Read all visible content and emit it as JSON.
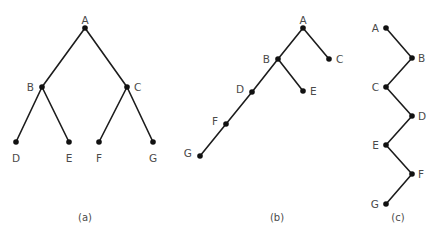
{
  "diagram": {
    "type": "binary-trees",
    "node_color": "#111111",
    "edge_color": "#1c1c1c",
    "label_color": "#4a4a4a",
    "trees": [
      {
        "id": "a",
        "caption": "(a)",
        "caption_pos": [
          85,
          217
        ],
        "description": "Complete (balanced) binary tree",
        "nodes": [
          {
            "id": "A",
            "label": "A",
            "x": 85,
            "y": 28,
            "lx": 85,
            "ly": 20,
            "anchor": "middle"
          },
          {
            "id": "B",
            "label": "B",
            "x": 42,
            "y": 87,
            "lx": 34,
            "ly": 87,
            "anchor": "end"
          },
          {
            "id": "C",
            "label": "C",
            "x": 127,
            "y": 87,
            "lx": 134,
            "ly": 87,
            "anchor": "start"
          },
          {
            "id": "D",
            "label": "D",
            "x": 16,
            "y": 142,
            "lx": 16,
            "ly": 158,
            "anchor": "middle"
          },
          {
            "id": "E",
            "label": "E",
            "x": 69,
            "y": 142,
            "lx": 69,
            "ly": 158,
            "anchor": "middle"
          },
          {
            "id": "F",
            "label": "F",
            "x": 99,
            "y": 142,
            "lx": 99,
            "ly": 158,
            "anchor": "middle"
          },
          {
            "id": "G",
            "label": "G",
            "x": 153,
            "y": 142,
            "lx": 153,
            "ly": 158,
            "anchor": "middle"
          }
        ],
        "edges": [
          [
            "A",
            "B"
          ],
          [
            "A",
            "C"
          ],
          [
            "B",
            "D"
          ],
          [
            "B",
            "E"
          ],
          [
            "C",
            "F"
          ],
          [
            "C",
            "G"
          ]
        ]
      },
      {
        "id": "b",
        "caption": "(b)",
        "caption_pos": [
          277,
          217
        ],
        "description": "Unbalanced, left-leaning binary tree",
        "nodes": [
          {
            "id": "A",
            "label": "A",
            "x": 303,
            "y": 28,
            "lx": 303,
            "ly": 20,
            "anchor": "middle"
          },
          {
            "id": "B",
            "label": "B",
            "x": 278,
            "y": 59,
            "lx": 270,
            "ly": 59,
            "anchor": "end"
          },
          {
            "id": "C",
            "label": "C",
            "x": 329,
            "y": 59,
            "lx": 336,
            "ly": 59,
            "anchor": "start"
          },
          {
            "id": "D",
            "label": "D",
            "x": 252,
            "y": 92,
            "lx": 244,
            "ly": 89,
            "anchor": "end"
          },
          {
            "id": "E",
            "label": "E",
            "x": 303,
            "y": 91,
            "lx": 310,
            "ly": 91,
            "anchor": "start"
          },
          {
            "id": "F",
            "label": "F",
            "x": 226,
            "y": 124,
            "lx": 218,
            "ly": 121,
            "anchor": "end"
          },
          {
            "id": "G",
            "label": "G",
            "x": 200,
            "y": 156,
            "lx": 192,
            "ly": 153,
            "anchor": "end"
          }
        ],
        "edges": [
          [
            "A",
            "B"
          ],
          [
            "A",
            "C"
          ],
          [
            "B",
            "D"
          ],
          [
            "B",
            "E"
          ],
          [
            "D",
            "F"
          ],
          [
            "F",
            "G"
          ]
        ]
      },
      {
        "id": "c",
        "caption": "(c)",
        "caption_pos": [
          398,
          217
        ],
        "description": "Degenerate zig-zag tree",
        "nodes": [
          {
            "id": "A",
            "label": "A",
            "x": 386,
            "y": 28,
            "lx": 379,
            "ly": 28,
            "anchor": "end"
          },
          {
            "id": "B",
            "label": "B",
            "x": 412,
            "y": 58,
            "lx": 418,
            "ly": 58,
            "anchor": "start"
          },
          {
            "id": "C",
            "label": "C",
            "x": 386,
            "y": 87,
            "lx": 379,
            "ly": 87,
            "anchor": "end"
          },
          {
            "id": "D",
            "label": "D",
            "x": 412,
            "y": 116,
            "lx": 418,
            "ly": 116,
            "anchor": "start"
          },
          {
            "id": "E",
            "label": "E",
            "x": 386,
            "y": 145,
            "lx": 379,
            "ly": 145,
            "anchor": "end"
          },
          {
            "id": "F",
            "label": "F",
            "x": 412,
            "y": 174,
            "lx": 418,
            "ly": 174,
            "anchor": "start"
          },
          {
            "id": "G",
            "label": "G",
            "x": 386,
            "y": 204,
            "lx": 379,
            "ly": 204,
            "anchor": "end"
          }
        ],
        "edges": [
          [
            "A",
            "B"
          ],
          [
            "B",
            "C"
          ],
          [
            "C",
            "D"
          ],
          [
            "D",
            "E"
          ],
          [
            "E",
            "F"
          ],
          [
            "F",
            "G"
          ]
        ]
      }
    ]
  }
}
